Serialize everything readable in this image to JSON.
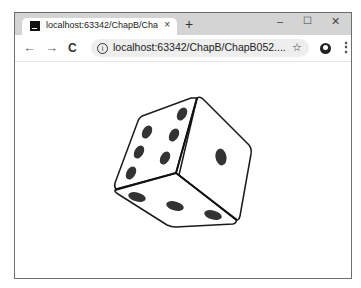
{
  "browser": {
    "tab": {
      "favicon": "intellij-icon",
      "title": "localhost:63342/ChapB/ChapB",
      "close_glyph": "×"
    },
    "new_tab_glyph": "+",
    "window_controls": {
      "minimize": "–",
      "maximize": "☐",
      "close": "✕"
    },
    "toolbar": {
      "back": "←",
      "forward": "→",
      "reload": "C",
      "info_icon": "i",
      "url": "localhost:63342/ChapB/ChapB052....",
      "bookmark_star": "☆",
      "menu": "⋮"
    }
  },
  "page": {
    "content": "3D die illustration",
    "die": {
      "faces": [
        {
          "name": "left",
          "pips": 6
        },
        {
          "name": "right",
          "pips": 1
        },
        {
          "name": "bottom",
          "pips": 3
        }
      ],
      "colors": {
        "face": "#ffffff",
        "edge": "#1a1a1a",
        "pip": "#333333"
      }
    }
  }
}
